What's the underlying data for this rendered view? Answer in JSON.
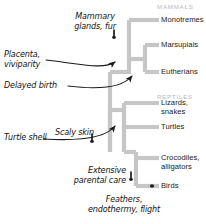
{
  "figure": {
    "type": "cladogram"
  },
  "groups": [
    {
      "id": "mammals",
      "label": "MAMMALS"
    },
    {
      "id": "reptiles",
      "label": "REPTILES"
    }
  ],
  "taxa": [
    {
      "id": "monotremes",
      "label": "Monotremes"
    },
    {
      "id": "marsupials",
      "label": "Marsupials"
    },
    {
      "id": "eutherians",
      "label": "Eutherians"
    },
    {
      "id": "lizards-snakes",
      "label": "Lizards,\nsnakes"
    },
    {
      "id": "turtles",
      "label": "Turtles"
    },
    {
      "id": "crocodiles-alligators",
      "label": "Crocodiles,\nalligators"
    },
    {
      "id": "birds",
      "label": "Birds"
    }
  ],
  "traits": [
    {
      "id": "mammary-glands-fur",
      "label": "Mammary\nglands, fur"
    },
    {
      "id": "placenta-viviparity",
      "label": "Placenta,\nviviparity"
    },
    {
      "id": "delayed-birth",
      "label": "Delayed birth"
    },
    {
      "id": "scaly-skin",
      "label": "Scaly skin"
    },
    {
      "id": "turtle-shell",
      "label": "Turtle shell"
    },
    {
      "id": "extensive-parental-care",
      "label": "Extensive\nparental care"
    },
    {
      "id": "feathers-endothermy-flight",
      "label": "Feathers,\nendothermy, flight"
    }
  ],
  "colors": {
    "branch": "#c6c6c6",
    "text": "#141414",
    "group_text": "#b9b9b9",
    "background": "#ffffff",
    "marker": "#222222"
  }
}
